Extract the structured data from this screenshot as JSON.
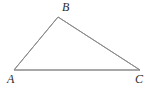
{
  "figure": {
    "kind": "geometry-diagram",
    "shape_name": "triangle",
    "background_color": "#ffffff",
    "stroke_color": "#8a8a8a",
    "stroke_width": 1,
    "label_color": "#2b2b2b",
    "width": 154,
    "height": 91
  },
  "vertices": {
    "A": {
      "label": "A",
      "x": 14,
      "y": 70
    },
    "B": {
      "label": "B",
      "x": 58,
      "y": 17
    },
    "C": {
      "label": "C",
      "x": 140,
      "y": 70
    }
  },
  "edges": [
    {
      "name": "AB",
      "from": "A",
      "to": "B"
    },
    {
      "name": "BC",
      "from": "B",
      "to": "C"
    },
    {
      "name": "CA",
      "from": "C",
      "to": "A"
    }
  ]
}
